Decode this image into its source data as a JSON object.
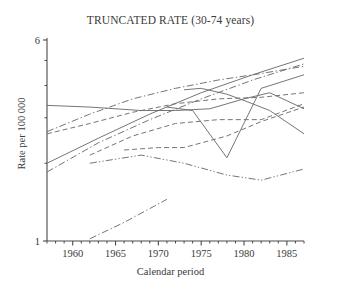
{
  "chart_data": {
    "type": "line",
    "title": "TRUNCATED RATE (30-74 years)",
    "xlabel": "Calendar period",
    "ylabel": "Rate per 100 000",
    "xlim": [
      1957,
      1987
    ],
    "ylim": [
      1,
      6
    ],
    "yscale": "log",
    "grid": false,
    "legend": "none",
    "x_tick_labels": [
      "1960",
      "1965",
      "1970",
      "1975",
      "1980",
      "1985"
    ],
    "x_tick_values": [
      1960,
      1965,
      1970,
      1975,
      1980,
      1985
    ],
    "x_minor_tick_values": [
      1957,
      1958,
      1959,
      1961,
      1962,
      1963,
      1964,
      1966,
      1967,
      1968,
      1969,
      1971,
      1972,
      1973,
      1974,
      1976,
      1977,
      1978,
      1979,
      1981,
      1982,
      1983,
      1984,
      1986,
      1987
    ],
    "y_tick_labels": [
      "1",
      "6"
    ],
    "y_tick_values": [
      1,
      6
    ],
    "y_minor_tick_values": [
      2,
      3,
      4,
      5
    ],
    "line_color": "#6e6e6e",
    "series": [
      {
        "name": "series-1",
        "style": "solid",
        "x": [
          1957,
          1962,
          1968,
          1972,
          1976,
          1980,
          1983,
          1987
        ],
        "y": [
          3.35,
          3.3,
          3.2,
          3.2,
          3.25,
          3.55,
          3.75,
          3.25
        ]
      },
      {
        "name": "series-2",
        "style": "dashed",
        "x": [
          1957,
          1962,
          1967,
          1972,
          1977,
          1982,
          1987
        ],
        "y": [
          2.6,
          2.85,
          3.15,
          3.4,
          3.55,
          3.6,
          3.75
        ]
      },
      {
        "name": "series-3",
        "style": "dash-dot",
        "x": [
          1957,
          1962,
          1967,
          1972,
          1977,
          1982,
          1987
        ],
        "y": [
          2.65,
          3.1,
          3.55,
          3.9,
          4.2,
          4.45,
          4.75
        ]
      },
      {
        "name": "series-4",
        "style": "solid",
        "x": [
          1957,
          1963,
          1969,
          1975,
          1981,
          1987
        ],
        "y": [
          2.0,
          2.5,
          3.1,
          3.75,
          4.4,
          5.1
        ]
      },
      {
        "name": "series-5",
        "style": "dash-dot",
        "x": [
          1957,
          1963,
          1969,
          1975,
          1981,
          1987
        ],
        "y": [
          1.85,
          2.4,
          2.95,
          3.55,
          4.2,
          4.85
        ]
      },
      {
        "name": "series-6",
        "style": "dashed",
        "x": [
          1962,
          1967,
          1972,
          1977,
          1982,
          1987
        ],
        "y": [
          2.15,
          2.55,
          2.85,
          2.95,
          2.95,
          3.4
        ]
      },
      {
        "name": "series-7",
        "style": "dashed",
        "x": [
          1966,
          1970,
          1973,
          1978,
          1982,
          1987
        ],
        "y": [
          2.25,
          2.3,
          2.3,
          2.55,
          2.9,
          3.3
        ]
      },
      {
        "name": "series-8",
        "style": "solid",
        "x": [
          1973,
          1975,
          1978,
          1980,
          1983,
          1987
        ],
        "y": [
          3.85,
          3.9,
          3.7,
          3.5,
          3.2,
          2.6
        ]
      },
      {
        "name": "series-9",
        "style": "solid",
        "x": [
          1971,
          1974,
          1978,
          1982,
          1987
        ],
        "y": [
          3.3,
          3.2,
          2.1,
          3.9,
          4.4
        ]
      },
      {
        "name": "series-10",
        "style": "dash-dot-dot",
        "x": [
          1962,
          1968,
          1973,
          1978,
          1982,
          1987
        ],
        "y": [
          2.0,
          2.15,
          2.0,
          1.8,
          1.72,
          1.9
        ]
      },
      {
        "name": "series-11",
        "style": "dash-dot",
        "x": [
          1962,
          1966,
          1971
        ],
        "y": [
          1.02,
          1.18,
          1.45
        ]
      }
    ]
  }
}
